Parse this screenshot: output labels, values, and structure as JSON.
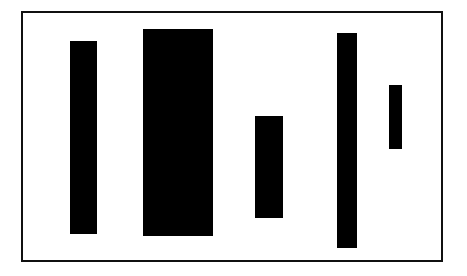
{
  "figure": {
    "background_color": "#ffffff",
    "width": 467,
    "height": 276
  },
  "frame": {
    "name": "plot-frame",
    "border_color": "#101010",
    "border_width": 2,
    "fill_color": "#ffffff",
    "x": 21,
    "y": 11,
    "width": 422,
    "height": 251
  },
  "chart_data": {
    "type": "bar",
    "title": "",
    "subtitle": "",
    "xlabel": "",
    "ylabel": "",
    "categories": [
      "1",
      "2",
      "3",
      "4",
      "5"
    ],
    "values": [
      193,
      207,
      102,
      215,
      64
    ],
    "series": [
      {
        "name": "bars",
        "values": [
          193,
          207,
          102,
          215,
          64
        ]
      }
    ],
    "bar_color": "#000000",
    "grid": false,
    "legend": false,
    "legend_position": "none",
    "axis_visible": false,
    "tick_labels_x": [],
    "tick_labels_y": [],
    "xlim": [
      0,
      422
    ],
    "ylim": [
      0,
      251
    ],
    "annotations": [],
    "note": "floating bars: each bar has an independent top and bottom offset within the frame",
    "bars": [
      {
        "id": "bar-1",
        "label": "",
        "x": 70,
        "y": 41,
        "width": 27,
        "height": 193,
        "color": "#000000"
      },
      {
        "id": "bar-2",
        "label": "",
        "x": 143,
        "y": 29,
        "width": 70,
        "height": 207,
        "color": "#000000"
      },
      {
        "id": "bar-3",
        "label": "",
        "x": 255,
        "y": 116,
        "width": 28,
        "height": 102,
        "color": "#000000"
      },
      {
        "id": "bar-4",
        "label": "",
        "x": 337,
        "y": 33,
        "width": 20,
        "height": 215,
        "color": "#000000"
      },
      {
        "id": "bar-5",
        "label": "",
        "x": 389,
        "y": 85,
        "width": 13,
        "height": 64,
        "color": "#000000"
      }
    ]
  }
}
